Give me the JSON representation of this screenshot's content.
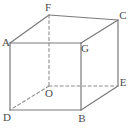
{
  "figure": {
    "kind": "geometry-diagram",
    "shape_name": "cube",
    "width": 131,
    "height": 130,
    "background_color": "#ffffff",
    "line_color": "#7a7a7a",
    "hidden_line_color": "#8d8d8d",
    "label_color": "#4a4a4a",
    "solid_line_width": 1.2,
    "dashed_line_width": 1.1,
    "dash_pattern": "3,2.6",
    "vertices": [
      {
        "id": "A",
        "label": "A",
        "x": 10,
        "y": 43,
        "label_x": 6,
        "label_y": 42,
        "hidden": false
      },
      {
        "id": "F",
        "label": "F",
        "x": 49,
        "y": 15,
        "label_x": 48,
        "label_y": 7,
        "hidden": false
      },
      {
        "id": "C",
        "label": "C",
        "x": 118,
        "y": 20,
        "label_x": 123,
        "label_y": 15,
        "hidden": false
      },
      {
        "id": "G",
        "label": "G",
        "x": 81,
        "y": 43,
        "label_x": 85,
        "label_y": 48,
        "hidden": false
      },
      {
        "id": "D",
        "label": "D",
        "x": 10,
        "y": 110,
        "label_x": 7,
        "label_y": 117,
        "hidden": false
      },
      {
        "id": "O",
        "label": "O",
        "x": 49,
        "y": 86,
        "label_x": 49,
        "label_y": 93,
        "hidden": true
      },
      {
        "id": "E",
        "label": "E",
        "x": 118,
        "y": 86,
        "label_x": 123,
        "label_y": 82,
        "hidden": false
      },
      {
        "id": "B",
        "label": "B",
        "x": 81,
        "y": 110,
        "label_x": 82,
        "label_y": 118,
        "hidden": false
      }
    ],
    "edges": [
      {
        "id": "A-F",
        "from": "A",
        "to": "F",
        "style": "solid"
      },
      {
        "id": "F-C",
        "from": "F",
        "to": "C",
        "style": "solid"
      },
      {
        "id": "C-G",
        "from": "C",
        "to": "G",
        "style": "solid"
      },
      {
        "id": "G-A",
        "from": "G",
        "to": "A",
        "style": "solid"
      },
      {
        "id": "A-D",
        "from": "A",
        "to": "D",
        "style": "solid"
      },
      {
        "id": "G-B",
        "from": "G",
        "to": "B",
        "style": "solid"
      },
      {
        "id": "C-E",
        "from": "C",
        "to": "E",
        "style": "solid"
      },
      {
        "id": "D-B",
        "from": "D",
        "to": "B",
        "style": "solid"
      },
      {
        "id": "B-E",
        "from": "B",
        "to": "E",
        "style": "solid"
      },
      {
        "id": "F-O",
        "from": "F",
        "to": "O",
        "style": "dashed"
      },
      {
        "id": "O-D",
        "from": "O",
        "to": "D",
        "style": "dashed"
      },
      {
        "id": "O-E",
        "from": "O",
        "to": "E",
        "style": "dashed"
      }
    ]
  }
}
